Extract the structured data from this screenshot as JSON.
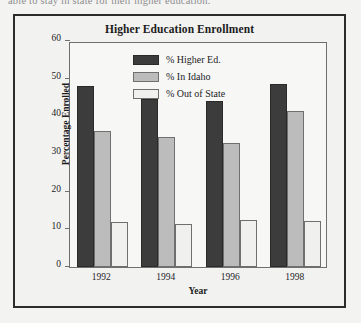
{
  "page": {
    "cutoff_text_above_figure": "able to stay in state for their higher education."
  },
  "figure": {
    "title": "Higher Education Enrollment"
  },
  "chart_data": {
    "type": "bar",
    "title": "Higher Education Enrollment",
    "xlabel": "Year",
    "ylabel": "Percentage Enrolled",
    "categories": [
      "1992",
      "1994",
      "1996",
      "1998"
    ],
    "ylim": [
      0,
      60
    ],
    "yticks": [
      0,
      10,
      20,
      30,
      40,
      50,
      60
    ],
    "grid": false,
    "legend_position": "inside-top-center",
    "series": [
      {
        "name": "% Higher Ed.",
        "color": "#3c3c3c",
        "values": [
          48,
          44.5,
          44,
          48.5
        ]
      },
      {
        "name": "% In Idaho",
        "color": "#bcbcbc",
        "values": [
          36,
          34.5,
          33,
          41.5
        ]
      },
      {
        "name": "% Out of State",
        "color": "#f0f0ef",
        "values": [
          12,
          11.3,
          12.4,
          12.2
        ]
      }
    ]
  }
}
